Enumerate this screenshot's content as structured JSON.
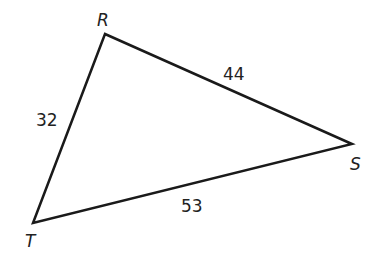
{
  "diagram": {
    "type": "triangle",
    "vertices": {
      "R": {
        "label": "R",
        "x": 105,
        "y": 34
      },
      "S": {
        "label": "S",
        "x": 352,
        "y": 144
      },
      "T": {
        "label": "T",
        "x": 33,
        "y": 223
      }
    },
    "sides": {
      "RT": {
        "label": "32"
      },
      "RS": {
        "label": "44"
      },
      "TS": {
        "label": "53"
      }
    }
  }
}
